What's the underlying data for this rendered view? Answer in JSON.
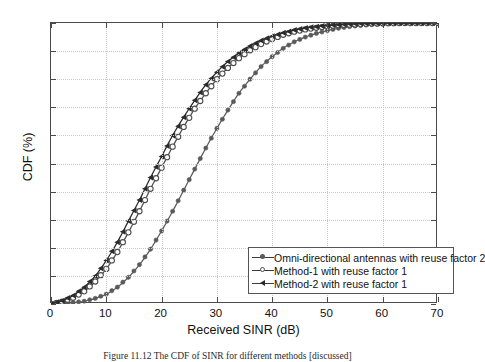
{
  "figure": {
    "caption": "Figure 11.12   The CDF of SINR for different methods [discussed]"
  },
  "axes": {
    "x_title": "Received SINR (dB)",
    "y_title": "CDF (%)",
    "x_ticks": [
      "0",
      "10",
      "20",
      "30",
      "40",
      "50",
      "60",
      "70"
    ],
    "y_ticks": [
      "0",
      "10",
      "20",
      "30",
      "40",
      "50",
      "60",
      "70",
      "80",
      "90",
      "100"
    ]
  },
  "legend": {
    "items": [
      {
        "label": "Omni-directional antennas with reuse factor 2",
        "marker": "filled-dot-marker",
        "color": "#5a5a5a"
      },
      {
        "label": "Method-1 with reuse factor 1",
        "marker": "open-circle-marker",
        "color": "#4d4d4d"
      },
      {
        "label": "Method-2 with reuse factor 1",
        "marker": "filled-triangle-marker",
        "color": "#2b2b2b"
      }
    ]
  },
  "chart_data": {
    "type": "line",
    "title": "",
    "xlabel": "Received SINR (dB)",
    "ylabel": "CDF (%)",
    "xlim": [
      0,
      70
    ],
    "ylim": [
      0,
      100
    ],
    "xticks": [
      0,
      10,
      20,
      30,
      40,
      50,
      60,
      70
    ],
    "yticks": [
      0,
      10,
      20,
      30,
      40,
      50,
      60,
      70,
      80,
      90,
      100
    ],
    "grid": true,
    "legend_position": "lower-center-right inside axes",
    "x": [
      0,
      2,
      4,
      6,
      8,
      10,
      12,
      14,
      16,
      18,
      20,
      22,
      24,
      26,
      28,
      30,
      32,
      34,
      36,
      38,
      40,
      42,
      44,
      46,
      48,
      50,
      52,
      54,
      56,
      58,
      60,
      62,
      64,
      66,
      68,
      70
    ],
    "series": [
      {
        "name": "Omni-directional antennas with reuse factor 2",
        "marker": "filled-dot",
        "color": "#5a5a5a",
        "values": [
          0,
          0.2,
          0.5,
          1.0,
          2.0,
          3.5,
          6.0,
          9.5,
          14.0,
          19.5,
          26.0,
          33.0,
          40.5,
          48.0,
          55.5,
          62.5,
          69.0,
          75.0,
          80.0,
          84.5,
          88.0,
          91.0,
          93.3,
          95.0,
          96.3,
          97.3,
          98.1,
          98.7,
          99.1,
          99.4,
          99.6,
          99.8,
          99.9,
          99.95,
          100,
          100
        ]
      },
      {
        "name": "Method-1 with reuse factor 1",
        "marker": "open-circle",
        "color": "#4d4d4d",
        "values": [
          0,
          0.8,
          2.2,
          4.5,
          8.0,
          12.5,
          18.5,
          25.5,
          33.0,
          41.0,
          48.5,
          56.0,
          63.0,
          69.5,
          75.0,
          80.0,
          84.0,
          87.5,
          90.3,
          92.5,
          94.3,
          95.8,
          96.9,
          97.7,
          98.3,
          98.8,
          99.2,
          99.4,
          99.6,
          99.8,
          99.9,
          99.95,
          100,
          100,
          100,
          100
        ]
      },
      {
        "name": "Method-2 with reuse factor 1",
        "marker": "filled-triangle",
        "color": "#2b2b2b",
        "values": [
          0,
          1.2,
          3.0,
          6.0,
          10.0,
          15.5,
          22.0,
          29.5,
          37.0,
          45.0,
          52.5,
          60.0,
          66.5,
          72.5,
          78.0,
          82.5,
          86.3,
          89.3,
          91.8,
          93.8,
          95.3,
          96.5,
          97.5,
          98.2,
          98.7,
          99.1,
          99.4,
          99.6,
          99.8,
          99.9,
          99.95,
          100,
          100,
          100,
          100,
          100
        ]
      }
    ]
  }
}
